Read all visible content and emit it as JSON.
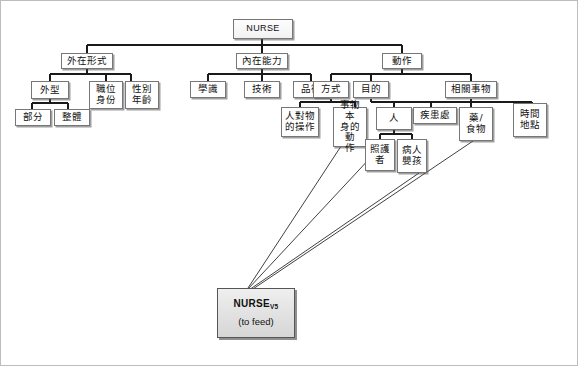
{
  "diagram": {
    "type": "hierarchical-tree",
    "title_node": "NURSE",
    "target_node": {
      "line1": "NURSE",
      "subscript": "V5",
      "line2": "(to feed)"
    },
    "nodes": {
      "root": "NURSE",
      "l1_a": "外在形式",
      "l1_b": "內在能力",
      "l1_c": "動作",
      "l2_a1": "外型",
      "l2_a2": "職位\n身份",
      "l2_a2_l1": "職位",
      "l2_a2_l2": "身份",
      "l2_a3": "性別\n年齡",
      "l2_a3_l1": "性別",
      "l2_a3_l2": "年齡",
      "l2_b1": "學識",
      "l2_b2": "技術",
      "l2_b3": "品德",
      "l2_c1": "方式",
      "l2_c2": "目的",
      "l2_c3": "相關事物",
      "l3_a1_1": "部分",
      "l3_a1_2": "整體",
      "l3_c1_1_l1": "人對物",
      "l3_c1_1_l2": "的操作",
      "l3_c1_2_l1": "事物本",
      "l3_c1_2_l2": "身的動",
      "l3_c1_2_l3": "作",
      "l3_c2_1": "人",
      "l3_c2_2": "疾患處",
      "l3_c3_1_l1": "藥/",
      "l3_c3_1_l2": "食物",
      "l3_c3_2_l1": "時間",
      "l3_c3_2_l2": "地點",
      "l4_人_1_l1": "照護",
      "l4_人_1_l2": "者",
      "l4_人_2_l1": "病人",
      "l4_人_2_l2": "嬰孩"
    },
    "arrow_sources": [
      "事物本身的動作",
      "照護者",
      "病人嬰孩",
      "藥/食物"
    ],
    "arrow_target": "NURSE V5 (to feed)",
    "colors": {
      "line": "#1a1a1a",
      "box_border": "#777777",
      "box_fill": "#ffffff",
      "target_fill": "#dcdcdc",
      "frame": "#bdbdbd"
    }
  }
}
